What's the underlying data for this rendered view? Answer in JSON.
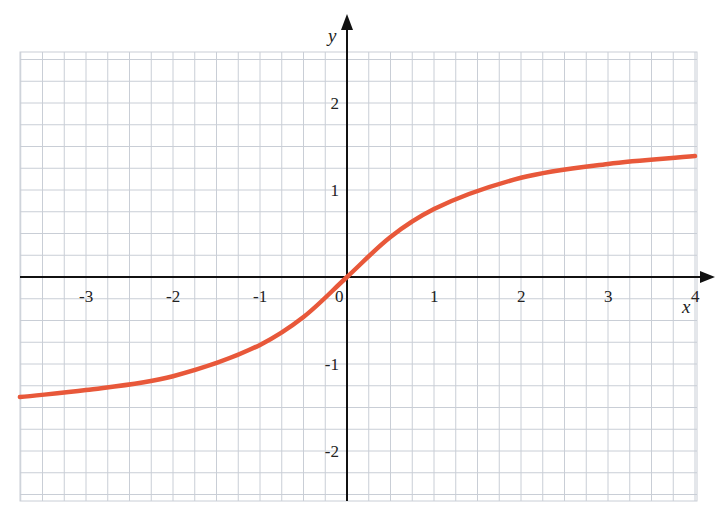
{
  "chart_data": {
    "type": "line",
    "title": "",
    "xlabel": "x",
    "ylabel": "y",
    "xlim": [
      -3.76,
      4.0
    ],
    "ylim": [
      -2.58,
      2.58
    ],
    "grid": true,
    "grid_minor_step": 0.25,
    "x_ticks": [
      "-3",
      "-2",
      "-1",
      "0",
      "1",
      "2",
      "3",
      "4"
    ],
    "y_ticks": [
      "2",
      "1",
      "-1",
      "-2"
    ],
    "series": [
      {
        "name": "curve",
        "color": "#E8583A",
        "x": [
          -3.76,
          -3,
          -2,
          -1,
          -0.5,
          0,
          0.5,
          1,
          2,
          3,
          4
        ],
        "y": [
          -1.38,
          -1.3,
          -1.14,
          -0.78,
          -0.46,
          0,
          0.46,
          0.78,
          1.14,
          1.3,
          1.39
        ]
      }
    ]
  },
  "colors": {
    "grid": "#c9ced6",
    "axis": "#111111",
    "curve": "#E8583A",
    "background": "#ffffff"
  }
}
